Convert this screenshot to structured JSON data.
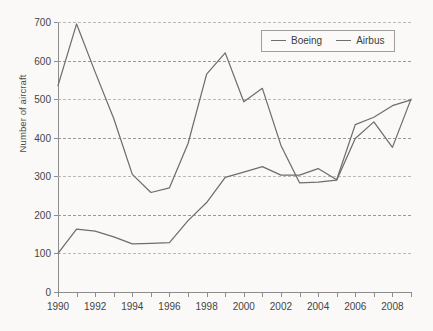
{
  "chart_data": {
    "type": "line",
    "title": "",
    "xlabel": "",
    "ylabel": "Number of aircraft",
    "ylim": [
      0,
      700
    ],
    "ytick_step": 100,
    "yticks": [
      0,
      100,
      200,
      300,
      400,
      500,
      600,
      700
    ],
    "xlim": [
      1990,
      2009
    ],
    "x": [
      1990,
      1991,
      1992,
      1993,
      1994,
      1995,
      1996,
      1997,
      1998,
      1999,
      2000,
      2001,
      2002,
      2003,
      2004,
      2005,
      2006,
      2007,
      2008,
      2009
    ],
    "xticks": [
      1990,
      1991,
      1992,
      1993,
      1994,
      1995,
      1996,
      1997,
      1998,
      1999,
      2000,
      2001,
      2002,
      2003,
      2004,
      2005,
      2006,
      2007,
      2008,
      2009
    ],
    "xtick_labels": [
      "1990",
      "",
      "1992",
      "",
      "1994",
      "",
      "1996",
      "",
      "1998",
      "",
      "2000",
      "",
      "2002",
      "",
      "2004",
      "",
      "2006",
      "",
      "2008",
      ""
    ],
    "grid": true,
    "grid_axis": "y",
    "grid_style": "dashed",
    "legend_position": "top-right",
    "series": [
      {
        "name": "Boeing",
        "color": "#6e6e6e",
        "values": [
          535,
          695,
          570,
          450,
          305,
          258,
          270,
          385,
          565,
          620,
          493,
          528,
          380,
          283,
          285,
          290,
          398,
          441,
          375,
          500
        ]
      },
      {
        "name": "Airbus",
        "color": "#6e6e6e",
        "values": [
          100,
          163,
          158,
          143,
          125,
          126,
          128,
          185,
          232,
          297,
          311,
          325,
          303,
          303,
          320,
          291,
          434,
          453,
          483,
          498
        ]
      }
    ]
  },
  "legend": {
    "items": [
      {
        "label": "Boeing",
        "swatch": "line-swatch-boeing"
      },
      {
        "label": "Airbus",
        "swatch": "line-swatch-airbus"
      }
    ]
  },
  "axes": {
    "y_title": "Number of aircraft"
  }
}
